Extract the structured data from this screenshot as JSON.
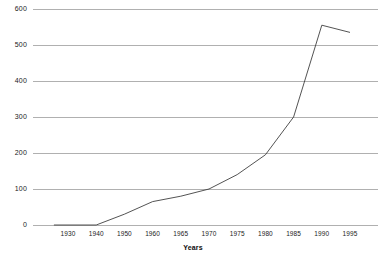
{
  "chart_data": {
    "type": "line",
    "title": "",
    "subtitle": "",
    "xlabel": "Years",
    "ylabel": "",
    "xlim": [
      1923,
      1997
    ],
    "ylim": [
      0,
      600
    ],
    "grid": true,
    "legend": false,
    "legend_position": "none",
    "x_tick_labels": [
      "1930",
      "1940",
      "1950",
      "1960",
      "1965",
      "1970",
      "1975",
      "1980",
      "1985",
      "1990",
      "1995"
    ],
    "x_tick_values": [
      1930,
      1940,
      1950,
      1960,
      1965,
      1970,
      1975,
      1980,
      1985,
      1990,
      1995
    ],
    "y_tick_labels": [
      "0",
      "100",
      "200",
      "300",
      "400",
      "500",
      "600"
    ],
    "y_tick_values": [
      0,
      100,
      200,
      300,
      400,
      500,
      600
    ],
    "series": [
      {
        "name": "series-1",
        "color": "#404040",
        "x": [
          1925,
          1930,
          1940,
          1950,
          1960,
          1965,
          1970,
          1975,
          1980,
          1985,
          1990,
          1995
        ],
        "values": [
          0,
          0,
          0,
          30,
          65,
          80,
          100,
          140,
          195,
          300,
          555,
          535
        ]
      }
    ],
    "annotations": []
  },
  "style": {
    "grid_color": "#b0b0b0",
    "line_color": "#3a3a3a",
    "text_color": "#1a1a1a",
    "background": "#ffffff"
  }
}
